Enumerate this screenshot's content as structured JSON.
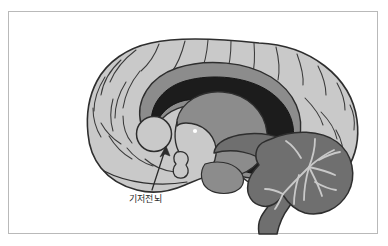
{
  "figure": {
    "type": "anatomical-illustration",
    "frame_border_color": "#b9b9b9",
    "background_color": "#ffffff"
  },
  "palette": {
    "cortex_fill": "#c9c9c9",
    "cortex_outline": "#2e2e2e",
    "corpus_callosum_fill": "#8c8c8c",
    "deep_structure_fill": "#1c1c1c",
    "cerebellum_fill": "#6f6f6f",
    "brainstem_fill": "#6f6f6f",
    "arbor_vitae_stroke": "#c9c9c9",
    "basal_forebrain_fill": "#c9c9c9",
    "leader_line_color": "#2b2b2b",
    "label_color": "#2b2b2b",
    "sulci_stroke": "#3a3a3a",
    "ventricle_dot_fill": "#ffffff"
  },
  "annotations": [
    {
      "id": "basal-forebrain",
      "label": "기저전뇌",
      "label_x": 128,
      "label_y": 186,
      "arrow_tip_x": 157,
      "arrow_tip_y": 137,
      "arrow_tail_x": 143,
      "arrow_tail_y": 178
    }
  ],
  "structures": [
    {
      "name": "cerebral-cortex",
      "fill": "#c9c9c9"
    },
    {
      "name": "corpus-callosum",
      "fill": "#8c8c8c"
    },
    {
      "name": "lateral-ventricle-thalamus",
      "fill": "#1c1c1c"
    },
    {
      "name": "fornix",
      "fill": "#8c8c8c"
    },
    {
      "name": "basal-forebrain-circle",
      "fill": "#c9c9c9"
    },
    {
      "name": "cerebellum",
      "fill": "#6f6f6f"
    },
    {
      "name": "brainstem",
      "fill": "#6f6f6f"
    },
    {
      "name": "pituitary-stalk",
      "fill": "#c9c9c9"
    }
  ]
}
